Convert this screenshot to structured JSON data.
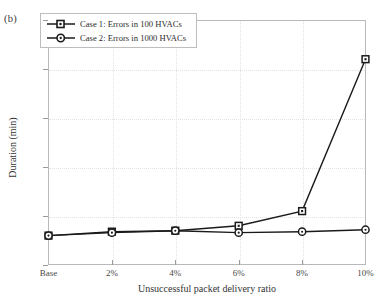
{
  "figure": {
    "panel_label": "(b)"
  },
  "chart_data": {
    "type": "line",
    "title": "",
    "xlabel": "Unsuccessful packet delivery ratio",
    "ylabel": "Duration (min)",
    "categories": [
      "Base",
      "2%",
      "4%",
      "6%",
      "8%",
      "10%"
    ],
    "series": [
      {
        "name": "Case 1: Errors in 100 HVACs",
        "marker": "square",
        "color": "#1a1a1a",
        "values": [
          3.0,
          3.4,
          3.5,
          4.0,
          5.5,
          21.0
        ]
      },
      {
        "name": "Case 2: Errors in 1000 HVACs",
        "marker": "circle",
        "color": "#1a1a1a",
        "values": [
          3.0,
          3.3,
          3.5,
          3.3,
          3.4,
          3.6
        ]
      }
    ],
    "ylim": [
      0,
      25
    ],
    "yticks": [
      0,
      5,
      10,
      15,
      20,
      25
    ],
    "ytick_labels": [
      "0",
      "5",
      "10",
      "15",
      "20",
      "25"
    ],
    "grid": true,
    "legend_position": "top-left"
  },
  "legend": {
    "entries": [
      {
        "label": "Case 1: Errors in 100 HVACs"
      },
      {
        "label": "Case 2: Errors in 1000 HVACs"
      }
    ]
  }
}
